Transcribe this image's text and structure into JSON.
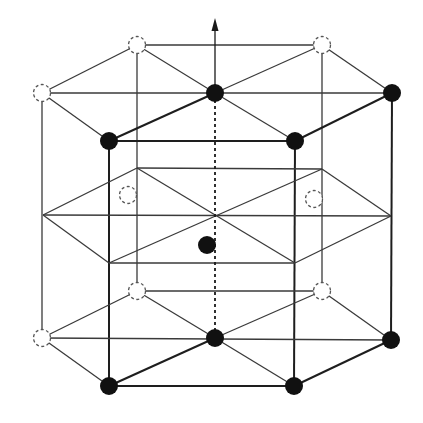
{
  "diagram": {
    "title": "",
    "colors": {
      "line": "#3a3a3a",
      "atom_solid": "#111111",
      "atom_dashed_stroke": "#555555",
      "background": "#ffffff"
    },
    "atom_radius": 9,
    "layers": {
      "top": {
        "y_center": 93,
        "atoms": [
          {
            "id": "t-back-left",
            "x": 137,
            "y": 45,
            "style": "dashed"
          },
          {
            "id": "t-back-right",
            "x": 322,
            "y": 45,
            "style": "dashed"
          },
          {
            "id": "t-left",
            "x": 42,
            "y": 93,
            "style": "dashed"
          },
          {
            "id": "t-center",
            "x": 215,
            "y": 93,
            "style": "solid"
          },
          {
            "id": "t-right",
            "x": 392,
            "y": 93,
            "style": "solid"
          },
          {
            "id": "t-front-left",
            "x": 109,
            "y": 141,
            "style": "solid"
          },
          {
            "id": "t-front-right",
            "x": 295,
            "y": 141,
            "style": "solid"
          }
        ]
      },
      "middle": {
        "atoms": [
          {
            "id": "m-left",
            "x": 128,
            "y": 195,
            "style": "dashed"
          },
          {
            "id": "m-right",
            "x": 314,
            "y": 199,
            "style": "dashed"
          },
          {
            "id": "m-center",
            "x": 207,
            "y": 245,
            "style": "solid"
          }
        ]
      },
      "bottom": {
        "y_center": 338,
        "atoms": [
          {
            "id": "b-back-left",
            "x": 137,
            "y": 291,
            "style": "dashed"
          },
          {
            "id": "b-back-right",
            "x": 322,
            "y": 291,
            "style": "dashed"
          },
          {
            "id": "b-left",
            "x": 42,
            "y": 338,
            "style": "dashed"
          },
          {
            "id": "b-center",
            "x": 215,
            "y": 338,
            "style": "solid"
          },
          {
            "id": "b-right",
            "x": 391,
            "y": 340,
            "style": "solid"
          },
          {
            "id": "b-front-left",
            "x": 109,
            "y": 386,
            "style": "solid"
          },
          {
            "id": "b-front-right",
            "x": 294,
            "y": 386,
            "style": "solid"
          }
        ]
      }
    },
    "c_axis": {
      "x": 215,
      "y_top": 18,
      "y_bottom": 338,
      "label": ""
    }
  }
}
